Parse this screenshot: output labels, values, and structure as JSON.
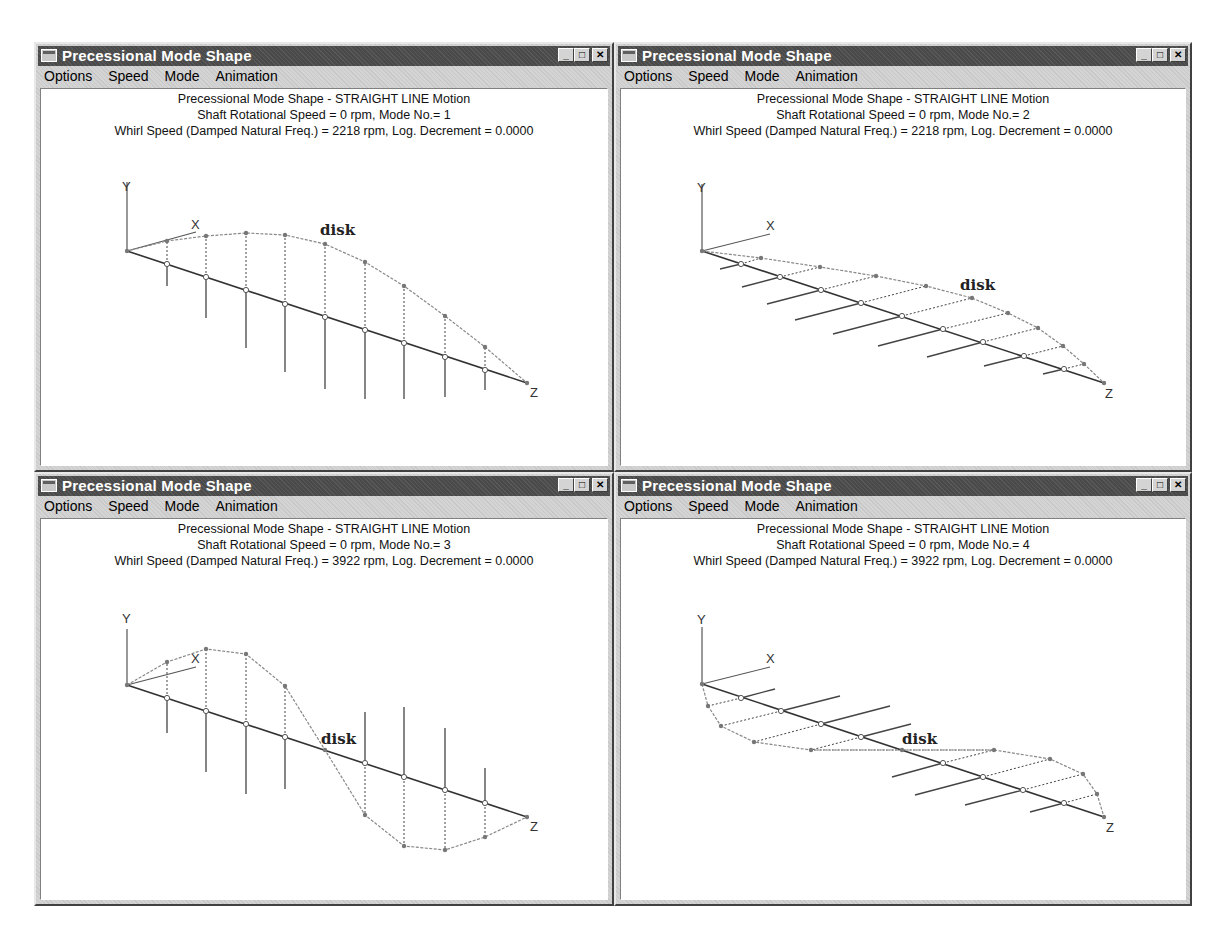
{
  "windows": [
    {
      "title": "Precessional Mode Shape",
      "menu": [
        "Options",
        "Speed",
        "Mode",
        "Animation"
      ],
      "menu_mnemonics": [
        "O",
        "S",
        "M",
        "A"
      ],
      "controls": [
        "minimize",
        "maximize",
        "close"
      ],
      "header": {
        "line1": "Precessional Mode Shape - STRAIGHT LINE Motion",
        "line2": "Shaft Rotational Speed = 0 rpm, Mode No.= 1",
        "line3": "Whirl Speed (Damped Natural Freq.) = 2218 rpm, Log. Decrement = 0.0000"
      },
      "plot": {
        "disk_label": "disk",
        "axis_labels": {
          "x": "X",
          "y": "Y",
          "z": "Z"
        }
      }
    },
    {
      "title": "Precessional Mode Shape",
      "menu": [
        "Options",
        "Speed",
        "Mode",
        "Animation"
      ],
      "menu_mnemonics": [
        "O",
        "S",
        "M",
        "A"
      ],
      "controls": [
        "minimize",
        "maximize",
        "close"
      ],
      "header": {
        "line1": "Precessional Mode Shape - STRAIGHT LINE Motion",
        "line2": "Shaft Rotational Speed = 0 rpm, Mode No.= 2",
        "line3": "Whirl Speed (Damped Natural Freq.) = 2218 rpm, Log. Decrement = 0.0000"
      },
      "plot": {
        "disk_label": "disk",
        "axis_labels": {
          "x": "X",
          "y": "Y",
          "z": "Z"
        }
      }
    },
    {
      "title": "Precessional Mode Shape",
      "menu": [
        "Options",
        "Speed",
        "Mode",
        "Animation"
      ],
      "menu_mnemonics": [
        "O",
        "S",
        "M",
        "A"
      ],
      "controls": [
        "minimize",
        "maximize",
        "close"
      ],
      "header": {
        "line1": "Precessional Mode Shape - STRAIGHT LINE Motion",
        "line2": "Shaft Rotational Speed = 0 rpm, Mode No.= 3",
        "line3": "Whirl Speed (Damped Natural Freq.) = 3922 rpm, Log. Decrement = 0.0000"
      },
      "plot": {
        "disk_label": "disk",
        "axis_labels": {
          "x": "X",
          "y": "Y",
          "z": "Z"
        }
      }
    },
    {
      "title": "Precessional Mode Shape",
      "menu": [
        "Options",
        "Speed",
        "Mode",
        "Animation"
      ],
      "menu_mnemonics": [
        "O",
        "S",
        "M",
        "A"
      ],
      "controls": [
        "minimize",
        "maximize",
        "close"
      ],
      "header": {
        "line1": "Precessional Mode Shape - STRAIGHT LINE Motion",
        "line2": "Shaft Rotational Speed = 0 rpm, Mode No.= 4",
        "line3": "Whirl Speed (Damped Natural Freq.) = 3922 rpm, Log. Decrement = 0.0000"
      },
      "plot": {
        "disk_label": "disk",
        "axis_labels": {
          "x": "X",
          "y": "Y",
          "z": "Z"
        }
      }
    }
  ],
  "colors": {
    "titlebar": "#4a4a4a",
    "window_bg": "#d4d4d4",
    "client_bg": "#ffffff",
    "shaft": "#333333",
    "mode_curve": "#888888"
  }
}
